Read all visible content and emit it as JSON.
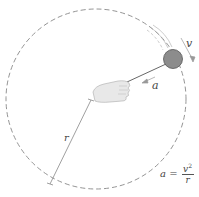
{
  "diagram": {
    "labels": {
      "velocity": "v",
      "acceleration": "a",
      "radius": "r",
      "formula_lhs": "a =",
      "formula_num": "v",
      "formula_num_exp": "2",
      "formula_den": "r"
    },
    "colors": {
      "circle": "#777777",
      "ball": "#8a8a8a",
      "ball_edge": "#555555",
      "hand": "#e6e6e6",
      "arrow": "#888888",
      "text": "#444444"
    }
  }
}
